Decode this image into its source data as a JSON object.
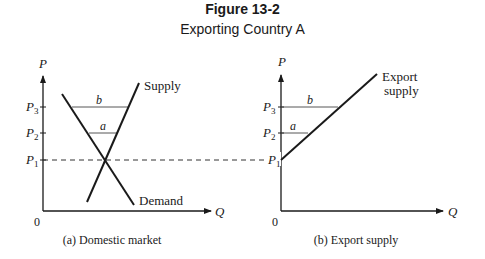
{
  "figure": {
    "number": "Figure 13-2",
    "title": "Exporting Country A"
  },
  "panels": [
    {
      "id": "a",
      "caption": "(a) Domestic market",
      "y_axis_label": "P",
      "x_axis_label": "Q",
      "origin_label": "0",
      "price_levels": [
        {
          "label": "P",
          "sub": "3"
        },
        {
          "label": "P",
          "sub": "2"
        },
        {
          "label": "P",
          "sub": "1"
        }
      ],
      "curves": [
        {
          "name": "Supply",
          "label": "Supply"
        },
        {
          "name": "Demand",
          "label": "Demand"
        }
      ],
      "gap_labels": {
        "b": "b",
        "a": "a"
      }
    },
    {
      "id": "b",
      "caption": "(b) Export supply",
      "y_axis_label": "P",
      "x_axis_label": "Q",
      "origin_label": "0",
      "price_levels": [
        {
          "label": "P",
          "sub": "3"
        },
        {
          "label": "P",
          "sub": "2"
        },
        {
          "label": "P",
          "sub": "1"
        }
      ],
      "curves": [
        {
          "name": "Export supply",
          "label_line1": "Export",
          "label_line2": "supply"
        }
      ],
      "gap_labels": {
        "b": "b",
        "a": "a"
      }
    }
  ],
  "colors": {
    "ink": "#1a1a1a",
    "thin_line": "#444444"
  }
}
